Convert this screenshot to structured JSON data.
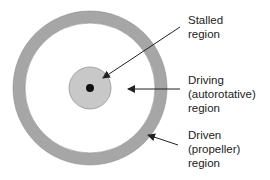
{
  "diagram": {
    "type": "rotor-disk-regions",
    "colors": {
      "background": "#ffffff",
      "outer_ring": "#a6a6a6",
      "outer_ring_stroke": "#8c8c8c",
      "inner_circle": "#c8c8c8",
      "inner_circle_stroke": "#8c8c8c",
      "center_dot": "#111111",
      "arrow": "#222222",
      "text": "#222222"
    },
    "labels": {
      "stalled": [
        "Stalled",
        "region"
      ],
      "driving": [
        "Driving",
        "(autorotative)",
        "region"
      ],
      "driven": [
        "Driven",
        "(propeller)",
        "region"
      ]
    }
  }
}
